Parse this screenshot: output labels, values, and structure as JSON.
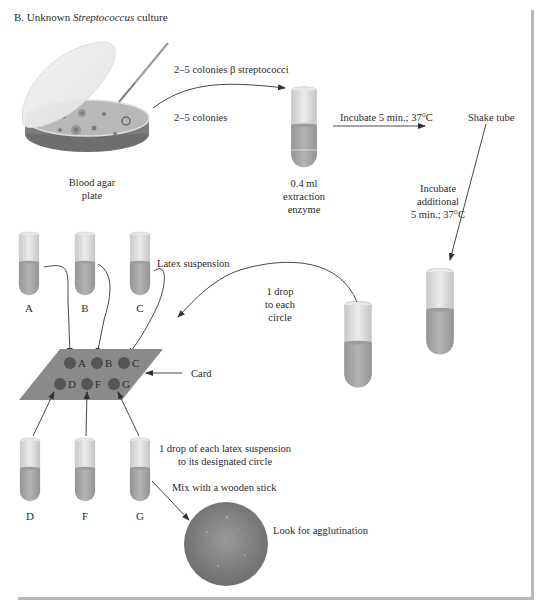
{
  "title": {
    "prefix": "B. Unknown ",
    "organism": "Streptococcus",
    "suffix": " culture"
  },
  "steps": {
    "plate_label_line1": "Blood agar",
    "plate_label_line2": "plate",
    "colonies_beta": "2–5 colonies β streptococci",
    "colonies": "2–5 colonies",
    "enzyme_line1": "0.4 ml",
    "enzyme_line2": "extraction",
    "enzyme_line3": "enzyme",
    "incubate": "Incubate 5 min.; 37°C",
    "shake": "Shake tube",
    "incubate2_line1": "Incubate",
    "incubate2_line2": "additional",
    "incubate2_line3": "5 min.; 37°C",
    "drop_line1": "1 drop",
    "drop_line2": "to each",
    "drop_line3": "circle",
    "latex": "Latex suspension",
    "card": "Card",
    "drop_each_line1": "1 drop of each latex suspension",
    "drop_each_line2": "to its designated circle",
    "mix": "Mix with a wooden stick",
    "look": "Look for agglutination"
  },
  "tubes_top": [
    "A",
    "B",
    "C"
  ],
  "tubes_bottom": [
    "D",
    "F",
    "G"
  ],
  "card_wells": [
    "A",
    "B",
    "C",
    "D",
    "F",
    "G"
  ],
  "colors": {
    "tube_glass": "#d9d9d9",
    "tube_liquid": "#a6a6a6",
    "card": "#8c8c8c",
    "well": "#555555",
    "agglutination_disc": "#7a7a7a",
    "arrow": "#333333",
    "frame": "#b8b8b8"
  }
}
